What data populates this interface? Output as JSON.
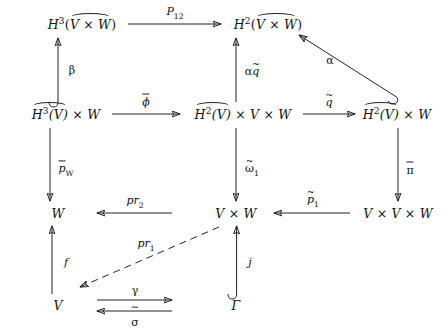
{
  "figure": {
    "kind": "commutative-diagram",
    "width": 448,
    "height": 334,
    "ink_color": "#222222",
    "background": "#ffffff"
  },
  "nodes": [
    {
      "id": "n_h3vw",
      "label": "H3(V x W)",
      "row": 1,
      "col": 1,
      "x": 82,
      "y": 24
    },
    {
      "id": "n_h2vw",
      "label": "H2(V x W)",
      "row": 1,
      "col": 2,
      "x": 268,
      "y": 24
    },
    {
      "id": "n_h3v_w",
      "label": "H3(V)^ x W",
      "row": 2,
      "col": 1,
      "x": 66,
      "y": 114
    },
    {
      "id": "n_h2v_vw",
      "label": "H2(V)^ x V x W",
      "row": 2,
      "col": 2,
      "x": 243,
      "y": 114
    },
    {
      "id": "n_h2v_w",
      "label": "H2(V)^ x W",
      "row": 2,
      "col": 3,
      "x": 397,
      "y": 114
    },
    {
      "id": "n_w",
      "label": "W",
      "row": 3,
      "col": 1,
      "x": 58,
      "y": 213
    },
    {
      "id": "n_vw",
      "label": "V x W",
      "row": 3,
      "col": 2,
      "x": 236,
      "y": 213
    },
    {
      "id": "n_vvw",
      "label": "V x V x W",
      "row": 3,
      "col": 3,
      "x": 398,
      "y": 213
    },
    {
      "id": "n_v",
      "label": "V",
      "row": 4,
      "col": 1,
      "x": 58,
      "y": 305
    },
    {
      "id": "n_gamma",
      "label": "Gamma",
      "row": 4,
      "col": 2,
      "x": 236,
      "y": 305
    }
  ],
  "arrows": [
    {
      "id": "a_p12",
      "label": "P12",
      "from": "n_h3vw",
      "to": "n_h2vw",
      "style": "solid",
      "head": "plain",
      "tail": "plain",
      "direction": "right",
      "label_pos": "above"
    },
    {
      "id": "a_beta",
      "label": "beta",
      "from": "n_h3v_w",
      "to": "n_h3vw",
      "style": "solid",
      "head": "plain",
      "tail": "hook",
      "direction": "up",
      "label_pos": "right"
    },
    {
      "id": "a_alphaq",
      "label": "alpha q~",
      "from": "n_h2v_vw",
      "to": "n_h2vw",
      "style": "solid",
      "head": "plain",
      "tail": "plain",
      "direction": "up",
      "label_pos": "right"
    },
    {
      "id": "a_alpha",
      "label": "alpha",
      "from": "n_h2v_w",
      "to": "n_h2vw",
      "style": "solid",
      "head": "plain",
      "tail": "hook",
      "direction": "up-left",
      "label_pos": "above"
    },
    {
      "id": "a_phi",
      "label": "phi-bar",
      "from": "n_h3v_w",
      "to": "n_h2v_vw",
      "style": "solid",
      "head": "plain",
      "tail": "plain",
      "direction": "right",
      "label_pos": "above"
    },
    {
      "id": "a_q",
      "label": "q-tilde",
      "from": "n_h2v_vw",
      "to": "n_h2v_w",
      "style": "solid",
      "head": "plain",
      "tail": "plain",
      "direction": "right",
      "label_pos": "above"
    },
    {
      "id": "a_pw",
      "label": "p-bar W",
      "from": "n_h3v_w",
      "to": "n_w",
      "style": "solid",
      "head": "plain",
      "tail": "plain",
      "direction": "down",
      "label_pos": "right"
    },
    {
      "id": "a_omega",
      "label": "omega~ 1",
      "from": "n_h2v_vw",
      "to": "n_vw",
      "style": "solid",
      "head": "plain",
      "tail": "plain",
      "direction": "down",
      "label_pos": "right"
    },
    {
      "id": "a_pi",
      "label": "pi-bar",
      "from": "n_h2v_w",
      "to": "n_vvw",
      "style": "solid",
      "head": "plain",
      "tail": "plain",
      "direction": "down",
      "label_pos": "right"
    },
    {
      "id": "a_pr2",
      "label": "pr2",
      "from": "n_vw",
      "to": "n_w",
      "style": "solid",
      "head": "plain",
      "tail": "plain",
      "direction": "left",
      "label_pos": "above"
    },
    {
      "id": "a_p1",
      "label": "p-tilde 1",
      "from": "n_vvw",
      "to": "n_vw",
      "style": "solid",
      "head": "plain",
      "tail": "plain",
      "direction": "left",
      "label_pos": "above"
    },
    {
      "id": "a_f",
      "label": "f",
      "from": "n_v",
      "to": "n_w",
      "style": "solid",
      "head": "plain",
      "tail": "plain",
      "direction": "up",
      "label_pos": "right"
    },
    {
      "id": "a_j",
      "label": "j",
      "from": "n_gamma",
      "to": "n_vw",
      "style": "solid",
      "head": "plain",
      "tail": "hook",
      "direction": "up",
      "label_pos": "right"
    },
    {
      "id": "a_pr1",
      "label": "pr1",
      "from": "n_vw",
      "to": "n_v",
      "style": "dashed",
      "head": "plain",
      "tail": "plain",
      "direction": "down-left",
      "label_pos": "above"
    },
    {
      "id": "a_gamma",
      "label": "gamma",
      "from": "n_v",
      "to": "n_gamma",
      "style": "solid",
      "head": "plain",
      "tail": "plain",
      "direction": "right",
      "label_pos": "above"
    },
    {
      "id": "a_sigma",
      "label": "sigma",
      "from": "n_gamma",
      "to": "n_v",
      "style": "solid",
      "head": "plain",
      "tail": "plain",
      "direction": "left",
      "label_pos": "below"
    }
  ],
  "labels": {
    "p12": "P",
    "p12_sub": "12",
    "beta": "β",
    "alpha": "α",
    "alpha_q_alpha": "α",
    "alpha_q_q": "q",
    "phi": "ϕ",
    "q": "q",
    "pw_p": "p",
    "pw_sub": "W",
    "omega": "ω",
    "omega_sub": "1",
    "pi": "π",
    "pr2_pr": "pr",
    "pr2_sub": "2",
    "p1_p": "p",
    "p1_sub": "1",
    "f": "f",
    "j": "j",
    "pr1_pr": "pr",
    "pr1_sub": "1",
    "gamma": "γ",
    "sigma": "σ",
    "iso_tilde": "∼"
  },
  "nodetext": {
    "h3vw_h": "H",
    "h3vw_sup": "3",
    "h3vw_inner": "V × W",
    "h2vw_h": "H",
    "h2vw_sup": "2",
    "h2vw_inner": "V × W",
    "h3v_w_inner": "H",
    "h3v_w_sup": "3",
    "h3v_w_v": "(V)",
    "h3v_w_rest": " × W",
    "h2v_vw_inner": "H",
    "h2v_vw_sup": "2",
    "h2v_vw_v": "(V)",
    "h2v_vw_rest": " × V × W",
    "h2v_w_inner": "H",
    "h2v_w_sup": "2",
    "h2v_w_v": "(V)",
    "h2v_w_rest": " × W",
    "w": "W",
    "vw": "V × W",
    "vvw": "V × V × W",
    "v": "V",
    "gamma_obj": "Γ"
  }
}
